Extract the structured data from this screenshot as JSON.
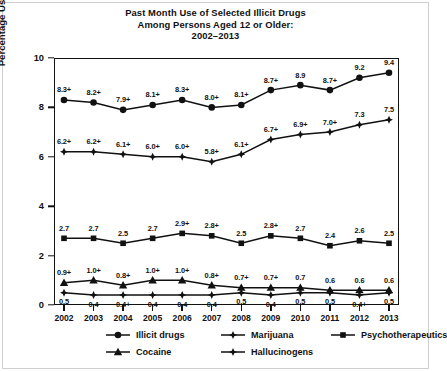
{
  "title": {
    "line1": "Past Month Use of Selected Illicit Drugs",
    "line2": "Among Persons Aged 12 or Older:",
    "line3": "2002–2013"
  },
  "axes": {
    "ylabel": "Percentage Using in Past Month",
    "yticks": [
      "0",
      "2",
      "4",
      "6",
      "8",
      "10"
    ],
    "xticks": [
      "2002",
      "2003",
      "2004",
      "2005",
      "2006",
      "2007",
      "2008",
      "2009",
      "2010",
      "2011",
      "2012",
      "2013"
    ]
  },
  "legend": {
    "items": [
      {
        "label": "Illicit drugs",
        "marker": "circle-marker"
      },
      {
        "label": "Marijuana",
        "marker": "cross-diamond-marker"
      },
      {
        "label": "Psychotherapeutics",
        "marker": "square-marker"
      },
      {
        "label": "Cocaine",
        "marker": "triangle-marker"
      },
      {
        "label": "Hallucinogens",
        "marker": "cross-diamond-marker"
      }
    ]
  },
  "chart_data": {
    "type": "line",
    "title": "Past Month Use of Selected Illicit Drugs Among Persons Aged 12 or Older: 2002–2013",
    "xlabel": "",
    "ylabel": "Percentage Using in Past Month",
    "ylim": [
      0,
      10
    ],
    "ytick_step": 2,
    "grid": false,
    "legend_position": "bottom",
    "x": [
      "2002",
      "2003",
      "2004",
      "2005",
      "2006",
      "2007",
      "2008",
      "2009",
      "2010",
      "2011",
      "2012",
      "2013"
    ],
    "series": [
      {
        "name": "Illicit drugs",
        "marker": "circle",
        "values": [
          8.3,
          8.2,
          7.9,
          8.1,
          8.3,
          8.0,
          8.1,
          8.7,
          8.9,
          8.7,
          9.2,
          9.4
        ],
        "labels": [
          "8.3+",
          "8.2+",
          "7.9+",
          "8.1+",
          "8.3+",
          "8.0+",
          "8.1+",
          "8.7+",
          "8.9",
          "8.7+",
          "9.2",
          "9.4"
        ]
      },
      {
        "name": "Marijuana",
        "marker": "cross-diamond",
        "values": [
          6.2,
          6.2,
          6.1,
          6.0,
          6.0,
          5.8,
          6.1,
          6.7,
          6.9,
          7.0,
          7.3,
          7.5
        ],
        "labels": [
          "6.2+",
          "6.2+",
          "6.1+",
          "6.0+",
          "6.0+",
          "5.8+",
          "6.1+",
          "6.7+",
          "6.9+",
          "7.0+",
          "7.3",
          "7.5"
        ]
      },
      {
        "name": "Psychotherapeutics",
        "marker": "square",
        "values": [
          2.7,
          2.7,
          2.5,
          2.7,
          2.9,
          2.8,
          2.5,
          2.8,
          2.7,
          2.4,
          2.6,
          2.5
        ],
        "labels": [
          "2.7",
          "2.7",
          "2.5",
          "2.7",
          "2.9+",
          "2.8+",
          "2.5",
          "2.8+",
          "2.7",
          "2.4",
          "2.6",
          "2.5"
        ]
      },
      {
        "name": "Cocaine",
        "marker": "triangle",
        "values": [
          0.9,
          1.0,
          0.8,
          1.0,
          1.0,
          0.8,
          0.7,
          0.7,
          0.7,
          0.6,
          0.6,
          0.6
        ],
        "labels": [
          "0.9+",
          "1.0+",
          "0.8+",
          "1.0+",
          "1.0+",
          "0.8+",
          "0.7+",
          "0.7+",
          "0.7",
          "0.6",
          "0.6",
          "0.6"
        ]
      },
      {
        "name": "Hallucinogens",
        "marker": "cross-diamond",
        "values": [
          0.5,
          0.4,
          0.4,
          0.4,
          0.4,
          0.4,
          0.5,
          0.4,
          0.5,
          0.5,
          0.4,
          0.5
        ],
        "labels": [
          "0.5",
          "0.4",
          "0.4+",
          "0.4",
          "0.4",
          "0.4",
          "0.5",
          "0.4",
          "0.5",
          "0.5",
          "0.4+",
          "0.5"
        ]
      }
    ],
    "label_overrides": {
      "Illicit drugs": {
        "8": "above",
        "10": "above"
      },
      "Hallucinogens": {
        "all": "below"
      }
    }
  }
}
